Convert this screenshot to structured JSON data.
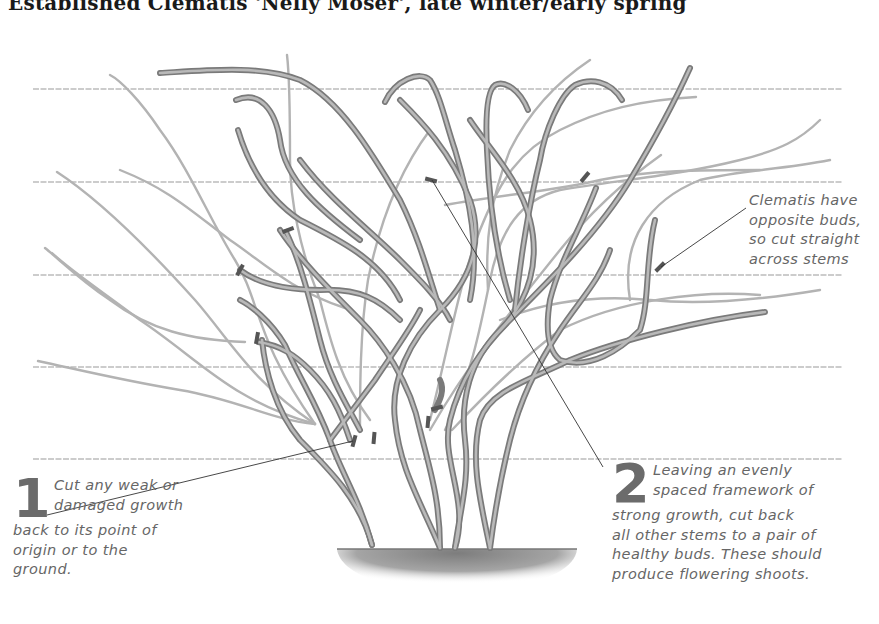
{
  "title": "Established Clematis 'Nelly Moser', late winter/early spring",
  "colors": {
    "wire": "#9a9a9a",
    "old_stem": "#7a7a7a",
    "old_stem_fill": "#a8a8a8",
    "young_stem": "#b0b0b0",
    "cut_mark": "#555555",
    "leader": "#333333",
    "text": "#666666",
    "ground": "#8a8a8a"
  },
  "wires": [
    {
      "y": 89,
      "x1": 33,
      "x2": 843
    },
    {
      "y": 182,
      "x1": 33,
      "x2": 843
    },
    {
      "y": 275,
      "x1": 33,
      "x2": 843
    },
    {
      "y": 367,
      "x1": 33,
      "x2": 843
    },
    {
      "y": 459,
      "x1": 33,
      "x2": 843
    }
  ],
  "annotations": [
    {
      "id": "step-1",
      "number": "1",
      "lines": [
        "Cut any weak or",
        "damaged growth",
        "back to its point of",
        "origin or to the",
        "ground."
      ]
    },
    {
      "id": "step-2",
      "number": "2",
      "lines": [
        "Leaving an evenly",
        "spaced framework of",
        "strong growth, cut back",
        "all other stems to a pair of",
        "healthy buds. These should",
        "produce flowering shoots."
      ]
    },
    {
      "id": "tip",
      "number": "",
      "lines": [
        "Clematis have",
        "opposite buds,",
        "so cut straight",
        "across stems"
      ]
    }
  ],
  "icons": {
    "cut_marker": "pruning-cut-icon",
    "ground": "soil-mound-icon"
  }
}
